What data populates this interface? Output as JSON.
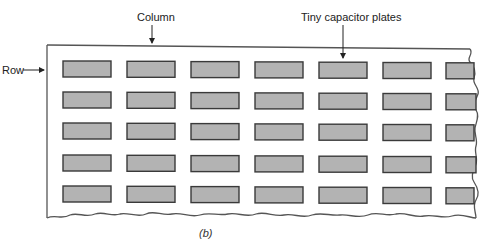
{
  "labels": {
    "column": "Column",
    "row": "Row",
    "plates": "Tiny capacitor plates",
    "caption": "(b)"
  },
  "grid": {
    "rows": 5,
    "columns": 7,
    "row_y": [
      61,
      92,
      123,
      155,
      186
    ],
    "col_x": [
      63,
      127,
      191,
      255,
      319,
      383,
      446
    ],
    "plate_width": 48,
    "plate_height": 16
  },
  "colors": {
    "plate_fill": "#b3b3b3",
    "plate_stroke": "#3a3a3a",
    "board_stroke": "#555555",
    "arrow": "#222222"
  }
}
